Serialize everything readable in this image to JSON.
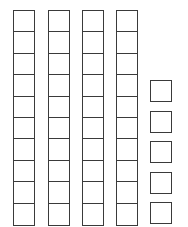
{
  "diagram": {
    "tens_rods": 4,
    "cells_per_rod": 10,
    "units": 5,
    "represented_value": 45,
    "stroke_color": "#3a3a3a",
    "fill_color": "#ffffff"
  }
}
